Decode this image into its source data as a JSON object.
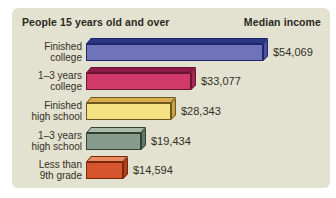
{
  "panel": {
    "background": "#e3e1d0"
  },
  "header": {
    "left": "People 15 years old and over",
    "right": "Median income"
  },
  "rows": [
    {
      "label_line1": "Finished",
      "label_line2": "college",
      "value": "$54,069",
      "bar": {
        "width_px": 177,
        "face": "#6e73ba",
        "top": "#2c3784",
        "side": "#4a50a2",
        "border": "#1d2769"
      }
    },
    {
      "label_line1": "1–3 years",
      "label_line2": "college",
      "value": "$33,077",
      "bar": {
        "width_px": 105,
        "face": "#cf3a68",
        "top": "#8e1c48",
        "side": "#a62853",
        "border": "#6e1436"
      }
    },
    {
      "label_line1": "Finished",
      "label_line2": "high school",
      "value": "$28,343",
      "bar": {
        "width_px": 85,
        "face": "#f4e184",
        "top": "#d8ab4c",
        "side": "#cfa143",
        "border": "#6d591f"
      }
    },
    {
      "label_line1": "1–3 years",
      "label_line2": "high school",
      "value": "$19,434",
      "bar": {
        "width_px": 55,
        "face": "#879c8d",
        "top": "#a9bba9",
        "side": "#66796b",
        "border": "#31402f"
      }
    },
    {
      "label_line1": "Less than",
      "label_line2": "9th grade",
      "value": "$14,594",
      "bar": {
        "width_px": 37,
        "face": "#d6552e",
        "top": "#e98c64",
        "side": "#b03f1d",
        "border": "#77290e"
      }
    }
  ],
  "chart_data": {
    "type": "bar",
    "orientation": "horizontal",
    "title_left": "People 15 years old and over",
    "title_right": "Median income",
    "categories": [
      "Finished college",
      "1–3 years college",
      "Finished high school",
      "1–3 years high school",
      "Less than 9th grade"
    ],
    "values": [
      54069,
      33077,
      28343,
      19434,
      14594
    ],
    "value_labels": [
      "$54,069",
      "$33,077",
      "$28,343",
      "$19,434",
      "$14,594"
    ],
    "xlim": [
      0,
      56000
    ],
    "grid": false,
    "legend": false,
    "bar_colors": [
      "#6e73ba",
      "#cf3a68",
      "#f4e184",
      "#879c8d",
      "#d6552e"
    ],
    "style": "3d-horizontal-bars on beige rounded panel"
  }
}
